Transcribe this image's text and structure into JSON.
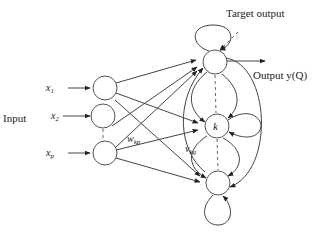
{
  "diagram": {
    "title_labels": {
      "input": "Input",
      "target_output": "Target output",
      "output": "Output y(Q)"
    },
    "input_nodes": [
      {
        "label": "x",
        "sub": "1"
      },
      {
        "label": "x",
        "sub": "2"
      },
      {
        "label": "x",
        "sub": "p"
      }
    ],
    "hidden_nodes": [
      {
        "label": ""
      },
      {
        "label": "k"
      },
      {
        "label": ""
      }
    ],
    "weights": {
      "input_weight": {
        "label": "w",
        "sub": "kp"
      },
      "recurrent_weight": {
        "label": "v",
        "sub": "kq"
      }
    },
    "colors": {
      "stroke": "#444444",
      "background": "#ffffff"
    }
  }
}
